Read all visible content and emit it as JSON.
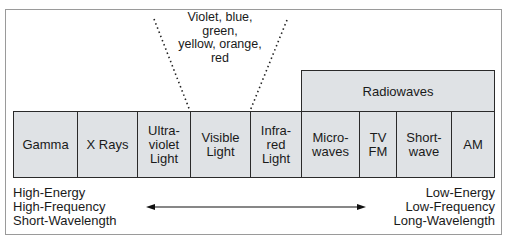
{
  "diagram": {
    "visible_note": "Violet, blue, green,\nyellow, orange,\nred",
    "group_label": "Radiowaves",
    "bands": [
      {
        "label": "Gamma",
        "x": 13,
        "w": 65
      },
      {
        "label": "X Rays",
        "x": 77,
        "w": 61
      },
      {
        "label": "Ultra-\nviolet\nLight",
        "x": 137,
        "w": 54
      },
      {
        "label": "Visible\nLight",
        "x": 190,
        "w": 61
      },
      {
        "label": "Infra-\nred\nLight",
        "x": 250,
        "w": 52
      },
      {
        "label": "Micro-\nwaves",
        "x": 301,
        "w": 59
      },
      {
        "label": "TV\nFM",
        "x": 359,
        "w": 38
      },
      {
        "label": "Short-\nwave",
        "x": 396,
        "w": 56
      },
      {
        "label": "AM",
        "x": 451,
        "w": 44
      }
    ],
    "left_end_label": "High-Energy\nHigh-Frequency\nShort-Wavelength",
    "right_end_label": "Low-Energy\nLow-Frequency\nLong-Wavelength",
    "colors": {
      "cell_fill": "#dfe2e5",
      "border": "#2a2a2a",
      "frame": "#9a9a9a"
    }
  }
}
